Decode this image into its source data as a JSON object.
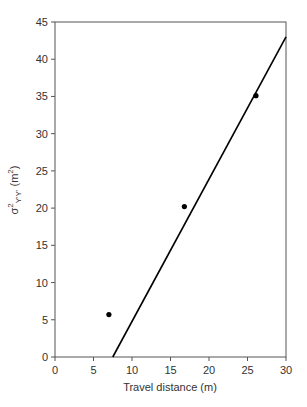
{
  "chart_data": {
    "type": "scatter",
    "title": "",
    "xlabel": "Travel distance (m)",
    "ylabel": "σ²Y'Y' (m²)",
    "ylabel_parts": {
      "symbol": "σ",
      "sup": "2",
      "sub": "Y'Y'",
      "unit": " (m",
      "unit_sup": "2",
      "unit_close": ")"
    },
    "xlim": [
      0,
      30
    ],
    "ylim": [
      0,
      45
    ],
    "xticks": [
      0,
      5,
      10,
      15,
      20,
      25,
      30
    ],
    "yticks": [
      0,
      5,
      10,
      15,
      20,
      25,
      30,
      35,
      40,
      45
    ],
    "grid": false,
    "legend": null,
    "series": [
      {
        "name": "observed",
        "kind": "scatter",
        "x": [
          7.0,
          16.8,
          26.1
        ],
        "y": [
          5.7,
          20.2,
          35.1
        ],
        "color": "#000000"
      },
      {
        "name": "linear fit",
        "kind": "line",
        "x": [
          7.5,
          30.0
        ],
        "y": [
          0.0,
          43.0
        ],
        "color": "#000000"
      }
    ]
  }
}
